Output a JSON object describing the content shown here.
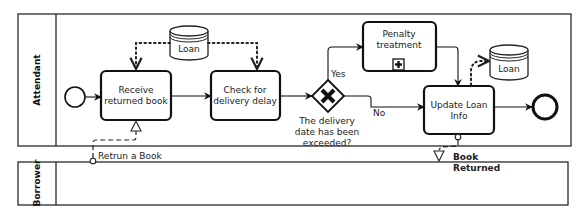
{
  "pools": [
    {
      "id": "attendant",
      "label": "Attendant"
    },
    {
      "id": "borrower",
      "label": "Borrower"
    }
  ],
  "start_event": {
    "type": "start"
  },
  "end_event": {
    "type": "end"
  },
  "tasks": {
    "receive": {
      "line1": "Receive",
      "line2": "returned book"
    },
    "check": {
      "line1": "Check for",
      "line2": "delivery delay"
    },
    "penalty": {
      "line1": "Penalty",
      "line2": "treatment",
      "marker": "subprocess-plus"
    },
    "update": {
      "line1": "Update Loan",
      "line2": "Info"
    }
  },
  "gateway": {
    "type": "exclusive",
    "label_lines": [
      "The delivery",
      "date has been",
      "exceeded?"
    ],
    "yes_label": "Yes",
    "no_label": "No"
  },
  "data_stores": [
    {
      "id": "loan-store-1",
      "label": "Loan"
    },
    {
      "id": "loan-store-2",
      "label": "Loan"
    }
  ],
  "message_flows": [
    {
      "label": "Retrun a Book",
      "from": "borrower",
      "to": "receive"
    },
    {
      "label_line1": "Book",
      "label_line2": "Returned",
      "from": "update",
      "to": "borrower"
    }
  ]
}
